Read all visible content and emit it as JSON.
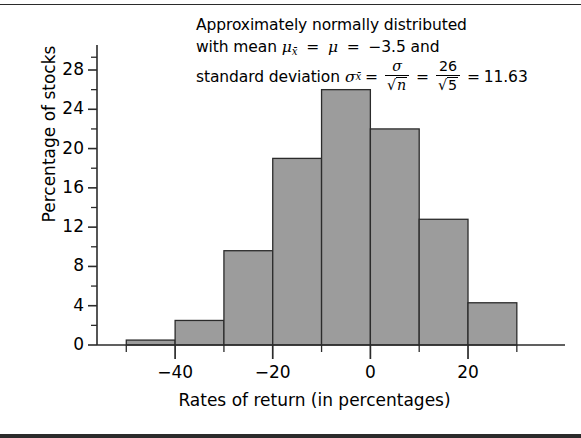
{
  "annotation": {
    "line1": "Approximately normally distributed",
    "line2_prefix": "with mean",
    "line2_mu_xbar": "μ",
    "line2_sub_xbar": "x̄",
    "line2_eq1": "=",
    "line2_mu": "μ",
    "line2_eq2": "=",
    "line2_value": "−3.5",
    "line2_suffix": "and",
    "line3_prefix": "standard deviation",
    "line3_sigma_xbar": "σ",
    "line3_sub_xbar": "x̄",
    "line3_eq1": "=",
    "line3_frac1_num": "σ",
    "line3_frac1_den_radicand": "n",
    "line3_eq2": "=",
    "line3_frac2_num": "26",
    "line3_frac2_den_radicand": "5",
    "line3_eq3": "=",
    "line3_result": "11.63",
    "radical": "√"
  },
  "chart_data": {
    "type": "bar",
    "title": "",
    "xlabel": "Rates of return (in percentages)",
    "ylabel": "Percentage of stocks",
    "categories": [
      "-50 to -40",
      "-40 to -30",
      "-30 to -20",
      "-20 to -10",
      "-10 to 0",
      "0 to 10",
      "10 to 20",
      "20 to 30"
    ],
    "bin_edges": [
      -50,
      -40,
      -30,
      -20,
      -10,
      0,
      10,
      20,
      30
    ],
    "values": [
      0.5,
      2.5,
      9.6,
      19.0,
      26.0,
      22.0,
      12.8,
      4.3
    ],
    "xlim": [
      -56,
      37
    ],
    "ylim": [
      0,
      29.5
    ],
    "xticks": [
      -40,
      -20,
      0,
      20
    ],
    "xtick_labels": [
      "−40",
      "−20",
      "0",
      "20"
    ],
    "xtick_minor_step": 10,
    "yticks": [
      0,
      4,
      8,
      12,
      16,
      20,
      24,
      28
    ],
    "ytick_labels": [
      "0",
      "4",
      "8",
      "12",
      "16",
      "20",
      "24",
      "28"
    ],
    "ytick_minor_step": 2,
    "grid": false,
    "legend": false,
    "bar_fill": "#9c9c9c",
    "bar_stroke": "#2b2b2b",
    "axis_color": "#2b2b2b"
  }
}
